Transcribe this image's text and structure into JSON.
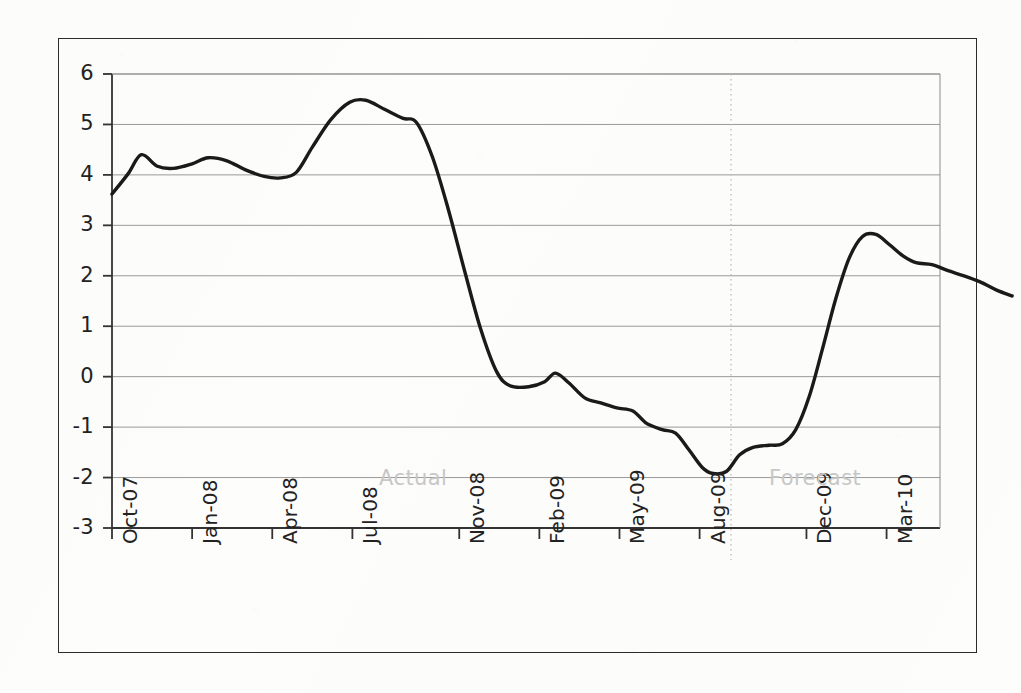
{
  "chart_data": {
    "type": "line",
    "title": "",
    "subtitle": "",
    "xlabel": "",
    "ylabel": "",
    "grid": true,
    "legend_position": "none",
    "ylim": [
      -3,
      6
    ],
    "ytick_labels": [
      "6",
      "5",
      "4",
      "3",
      "2",
      "1",
      "0",
      "-1",
      "-2",
      "-3"
    ],
    "ytick_values": [
      6,
      5,
      4,
      3,
      2,
      1,
      0,
      -1,
      -2,
      -3
    ],
    "xtick_labels": [
      "Oct-07",
      "Jan-08",
      "Apr-08",
      "Jul-08",
      "Nov-08",
      "Feb-09",
      "May-09",
      "Aug-09",
      "Dec-09",
      "Mar-10"
    ],
    "xtick_positions": [
      0,
      3,
      6,
      9,
      13,
      16,
      19,
      22,
      26,
      29
    ],
    "xlim": [
      0,
      31
    ],
    "annotations": [
      {
        "text": "Actual",
        "x": 10.0,
        "y": -2.05,
        "color": "#c8c8c8"
      },
      {
        "text": "Forecast",
        "x": 24.6,
        "y": -2.05,
        "color": "#c8c8c8"
      }
    ],
    "divider": {
      "x": 22.5,
      "style": "dotted",
      "color": "#bdbdbd"
    },
    "series": [
      {
        "name": "series-1",
        "color": "#1a1a1a",
        "x": [
          0,
          1,
          2,
          3,
          4,
          5,
          6,
          7,
          8,
          9,
          10,
          11,
          12,
          13,
          14,
          15,
          16,
          17,
          18,
          19,
          20,
          21,
          22,
          23,
          24,
          25,
          26,
          27,
          28,
          29,
          30,
          31
        ],
        "values": [
          3.6,
          4.4,
          4.15,
          4.2,
          4.35,
          4.2,
          3.95,
          3.95,
          4.6,
          5.45,
          5.4,
          5.1,
          4.2,
          2.4,
          0.4,
          -0.2,
          -0.15,
          0.08,
          -0.3,
          -0.5,
          -0.6,
          -0.9,
          -1.05,
          -1.2,
          -1.9,
          -1.55,
          -1.4,
          -1.35,
          -0.6,
          1.6,
          2.8,
          2.7
        ],
        "x_labels": [
          "Oct-07",
          "Nov-07",
          "Dec-07",
          "Jan-08",
          "Feb-08",
          "Mar-08",
          "Apr-08",
          "May-08",
          "Jun-08",
          "Jul-08",
          "Aug-08",
          "Sep-08",
          "Oct-08",
          "Nov-08",
          "Dec-08",
          "Jan-09",
          "Feb-09",
          "Mar-09",
          "Apr-09",
          "May-09",
          "Jun-09",
          "Jul-09",
          "Aug-09",
          "Sep-09",
          "Oct-09",
          "Nov-09",
          "Dec-09",
          "Jan-10",
          "Feb-10",
          "Mar-10",
          "Apr-10",
          "May-10"
        ]
      }
    ],
    "series_points": [
      {
        "t": 0.0,
        "v": 3.62
      },
      {
        "t": 0.6,
        "v": 4.02
      },
      {
        "t": 1.1,
        "v": 4.4
      },
      {
        "t": 1.7,
        "v": 4.17
      },
      {
        "t": 2.3,
        "v": 4.13
      },
      {
        "t": 3.0,
        "v": 4.22
      },
      {
        "t": 3.6,
        "v": 4.34
      },
      {
        "t": 4.3,
        "v": 4.28
      },
      {
        "t": 5.0,
        "v": 4.1
      },
      {
        "t": 5.7,
        "v": 3.97
      },
      {
        "t": 6.3,
        "v": 3.94
      },
      {
        "t": 6.9,
        "v": 4.05
      },
      {
        "t": 7.5,
        "v": 4.55
      },
      {
        "t": 8.2,
        "v": 5.1
      },
      {
        "t": 8.9,
        "v": 5.44
      },
      {
        "t": 9.5,
        "v": 5.48
      },
      {
        "t": 10.2,
        "v": 5.3
      },
      {
        "t": 10.9,
        "v": 5.12
      },
      {
        "t": 11.4,
        "v": 5.04
      },
      {
        "t": 12.0,
        "v": 4.35
      },
      {
        "t": 12.6,
        "v": 3.3
      },
      {
        "t": 13.2,
        "v": 2.1
      },
      {
        "t": 13.8,
        "v": 0.95
      },
      {
        "t": 14.4,
        "v": 0.1
      },
      {
        "t": 14.9,
        "v": -0.18
      },
      {
        "t": 15.6,
        "v": -0.2
      },
      {
        "t": 16.2,
        "v": -0.1
      },
      {
        "t": 16.6,
        "v": 0.07
      },
      {
        "t": 17.1,
        "v": -0.12
      },
      {
        "t": 17.7,
        "v": -0.42
      },
      {
        "t": 18.3,
        "v": -0.52
      },
      {
        "t": 18.9,
        "v": -0.62
      },
      {
        "t": 19.5,
        "v": -0.68
      },
      {
        "t": 20.0,
        "v": -0.92
      },
      {
        "t": 20.6,
        "v": -1.05
      },
      {
        "t": 21.1,
        "v": -1.12
      },
      {
        "t": 21.6,
        "v": -1.45
      },
      {
        "t": 22.1,
        "v": -1.8
      },
      {
        "t": 22.5,
        "v": -1.92
      },
      {
        "t": 23.0,
        "v": -1.88
      },
      {
        "t": 23.5,
        "v": -1.55
      },
      {
        "t": 24.0,
        "v": -1.4
      },
      {
        "t": 24.6,
        "v": -1.36
      },
      {
        "t": 25.1,
        "v": -1.33
      },
      {
        "t": 25.6,
        "v": -1.05
      },
      {
        "t": 26.1,
        "v": -0.4
      },
      {
        "t": 26.6,
        "v": 0.55
      },
      {
        "t": 27.1,
        "v": 1.55
      },
      {
        "t": 27.6,
        "v": 2.35
      },
      {
        "t": 28.1,
        "v": 2.78
      },
      {
        "t": 28.6,
        "v": 2.82
      },
      {
        "t": 29.1,
        "v": 2.62
      },
      {
        "t": 29.6,
        "v": 2.4
      },
      {
        "t": 30.1,
        "v": 2.26
      },
      {
        "t": 30.7,
        "v": 2.22
      },
      {
        "t": 31.3,
        "v": 2.1
      },
      {
        "t": 31.9,
        "v": 2.0
      },
      {
        "t": 32.5,
        "v": 1.88
      },
      {
        "t": 33.1,
        "v": 1.72
      },
      {
        "t": 33.7,
        "v": 1.6
      }
    ]
  }
}
